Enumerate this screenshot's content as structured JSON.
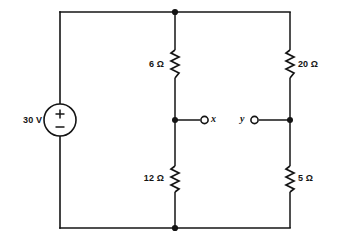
{
  "diagram": {
    "type": "electrical-schematic",
    "line_color": "#141414",
    "background_color": "#ffffff"
  },
  "source": {
    "label": "30 V",
    "value": 30,
    "unit": "V",
    "kind": "dc-voltage-source",
    "polarity_top": "+",
    "polarity_bottom": "−"
  },
  "resistors": [
    {
      "id": "r6",
      "label": "6 Ω",
      "value": 6,
      "unit": "Ω",
      "branch": "middle",
      "position": "upper",
      "label_side": "left"
    },
    {
      "id": "r12",
      "label": "12 Ω",
      "value": 12,
      "unit": "Ω",
      "branch": "middle",
      "position": "lower",
      "label_side": "left"
    },
    {
      "id": "r20",
      "label": "20 Ω",
      "value": 20,
      "unit": "Ω",
      "branch": "right",
      "position": "upper",
      "label_side": "right"
    },
    {
      "id": "r5",
      "label": "5 Ω",
      "value": 5,
      "unit": "Ω",
      "branch": "right",
      "position": "lower",
      "label_side": "right"
    }
  ],
  "terminals": [
    {
      "id": "x",
      "label": "x",
      "label_side": "right",
      "connected_branch": "middle"
    },
    {
      "id": "y",
      "label": "y",
      "label_side": "left",
      "connected_branch": "right"
    }
  ],
  "nodes": [
    {
      "id": "top-middle",
      "x": 175,
      "y": 12
    },
    {
      "id": "bottom-middle",
      "x": 175,
      "y": 228
    },
    {
      "id": "middle-tap",
      "x": 175,
      "y": 120
    },
    {
      "id": "right-tap",
      "x": 290,
      "y": 120
    }
  ]
}
